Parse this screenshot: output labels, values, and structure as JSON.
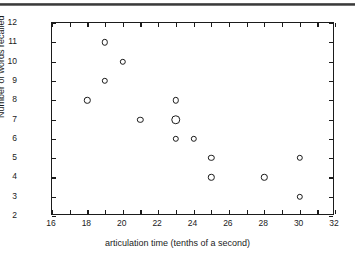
{
  "figure": {
    "has_top_rule": true
  },
  "chart_data": {
    "type": "scatter",
    "title": "",
    "xlabel": "articulation time (tenths of a second)",
    "ylabel": "Number of words recalled",
    "xlim": [
      16,
      32
    ],
    "ylim": [
      2,
      12
    ],
    "x_ticks": [
      16,
      18,
      20,
      22,
      24,
      26,
      28,
      30,
      32
    ],
    "x_minor_step": 1,
    "y_ticks": [
      2,
      3,
      4,
      5,
      6,
      7,
      8,
      9,
      10,
      11,
      12
    ],
    "grid": false,
    "legend": false,
    "marker": "open-circle",
    "points": [
      {
        "x": 18,
        "y": 8,
        "count": 1
      },
      {
        "x": 19,
        "y": 11,
        "count": 1
      },
      {
        "x": 19,
        "y": 9,
        "count": 1
      },
      {
        "x": 20,
        "y": 10,
        "count": 1
      },
      {
        "x": 21,
        "y": 7,
        "count": 1
      },
      {
        "x": 23,
        "y": 8,
        "count": 1
      },
      {
        "x": 23,
        "y": 7,
        "count": 2
      },
      {
        "x": 23,
        "y": 6,
        "count": 1
      },
      {
        "x": 24,
        "y": 6,
        "count": 1
      },
      {
        "x": 25,
        "y": 5,
        "count": 1
      },
      {
        "x": 25,
        "y": 4,
        "count": 1
      },
      {
        "x": 28,
        "y": 4,
        "count": 1
      },
      {
        "x": 30,
        "y": 5,
        "count": 1
      },
      {
        "x": 30,
        "y": 3,
        "count": 1
      }
    ],
    "colors": {
      "axis": "#1b1b1b",
      "marker": "#1b1b1b",
      "background": "#ffffff"
    }
  }
}
